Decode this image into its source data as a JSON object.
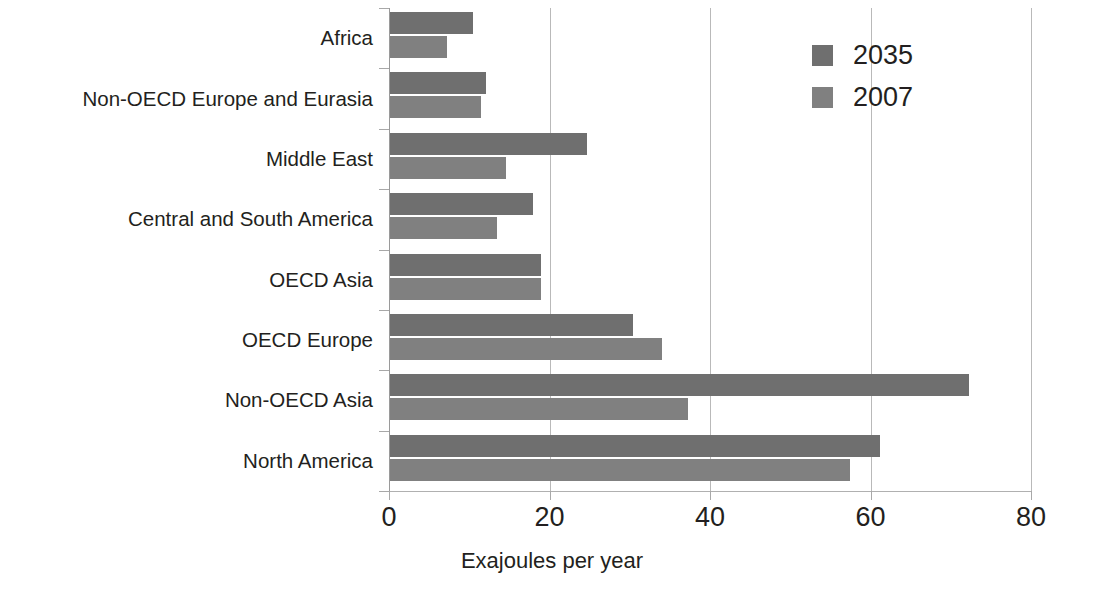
{
  "chart_data": {
    "type": "bar",
    "orientation": "horizontal",
    "title": "",
    "xlabel": "Exajoules per year",
    "ylabel": "",
    "xlim": [
      0,
      80
    ],
    "xticks": [
      "0",
      "20",
      "40",
      "60",
      "80"
    ],
    "xtick_values": [
      0,
      20,
      40,
      60,
      80
    ],
    "grid": "vertical",
    "legend_position": "top-right",
    "categories": [
      "Africa",
      "Non-OECD Europe and Eurasia",
      "Middle East",
      "Central and South America",
      "OECD Asia",
      "OECD Europe",
      "Non-OECD Asia",
      "North America"
    ],
    "series": [
      {
        "name": "2035",
        "color": "#6f6f6f",
        "values": [
          10.5,
          12.1,
          24.7,
          18.0,
          18.9,
          30.4,
          72.3,
          61.2
        ]
      },
      {
        "name": "2007",
        "color": "#808080",
        "values": [
          7.2,
          11.5,
          14.6,
          13.5,
          18.9,
          34.0,
          37.3,
          57.4
        ]
      }
    ]
  },
  "legend": {
    "items": [
      {
        "label": "2035",
        "color": "#6f6f6f"
      },
      {
        "label": "2007",
        "color": "#808080"
      }
    ]
  }
}
